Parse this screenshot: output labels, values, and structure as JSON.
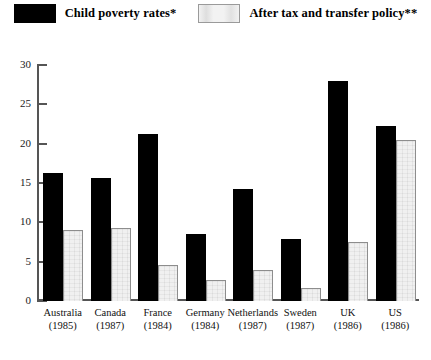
{
  "legend": {
    "entries": [
      {
        "label": "Child poverty rates*",
        "swatch": "black-swatch",
        "color": "#000000"
      },
      {
        "label": "After tax and transfer policy**",
        "swatch": "white-swatch",
        "color": "#f0f0f0"
      }
    ]
  },
  "axis": {
    "y_ticks": [
      "0",
      "5",
      "10",
      "15",
      "20",
      "25",
      "30"
    ]
  },
  "categories": [
    {
      "country": "Australia",
      "year": "(1985)"
    },
    {
      "country": "Canada",
      "year": "(1987)"
    },
    {
      "country": "France",
      "year": "(1984)"
    },
    {
      "country": "Germany",
      "year": "(1984)"
    },
    {
      "country": "Netherlands",
      "year": "(1987)"
    },
    {
      "country": "Sweden",
      "year": "(1987)"
    },
    {
      "country": "UK",
      "year": "(1986)"
    },
    {
      "country": "US",
      "year": "(1986)"
    }
  ],
  "chart_data": {
    "type": "bar",
    "title": "",
    "xlabel": "",
    "ylabel": "",
    "ylim": [
      0,
      30
    ],
    "ytick_step": 5,
    "grid": false,
    "legend_position": "top-center",
    "categories": [
      "Australia (1985)",
      "Canada (1987)",
      "France (1984)",
      "Germany (1984)",
      "Netherlands (1987)",
      "Sweden (1987)",
      "UK (1986)",
      "US (1986)"
    ],
    "series": [
      {
        "name": "Child poverty rates*",
        "color": "#000000",
        "values": [
          16.3,
          15.7,
          21.2,
          8.5,
          14.2,
          7.9,
          28.0,
          22.3
        ]
      },
      {
        "name": "After tax and transfer policy**",
        "color": "#f0f0f0",
        "values": [
          9.0,
          9.3,
          4.6,
          2.7,
          3.9,
          1.6,
          7.5,
          20.5
        ]
      }
    ]
  }
}
